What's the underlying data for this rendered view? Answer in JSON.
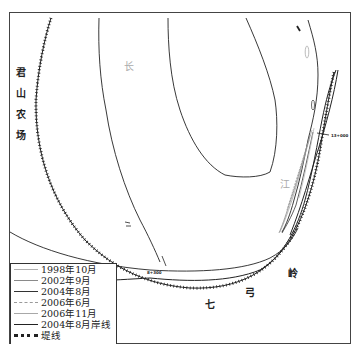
{
  "map": {
    "labels": {
      "farm": [
        "君",
        "山",
        "农",
        "场"
      ],
      "river_chang": "长",
      "river_jiang": "江",
      "qi": "七",
      "gong": "弓",
      "ling": "岭"
    },
    "chainage": {
      "left": "8+300",
      "right": "13+000"
    }
  },
  "legend": {
    "items": [
      {
        "label": "1998年10月",
        "color": "#b0b0b0",
        "style": "solid"
      },
      {
        "label": "2002年9月",
        "color": "#8a8a8a",
        "style": "solid"
      },
      {
        "label": "2004年8月",
        "color": "#333333",
        "style": "solid"
      },
      {
        "label": "2006年6月",
        "color": "#9a9a9a",
        "style": "dashed"
      },
      {
        "label": "2006年11月",
        "color": "#a8a8a8",
        "style": "solid"
      },
      {
        "label": "2004年8月岸线",
        "color": "#222222",
        "style": "solid"
      },
      {
        "label": "堤线",
        "color": "#222222",
        "style": "hatched"
      }
    ]
  }
}
